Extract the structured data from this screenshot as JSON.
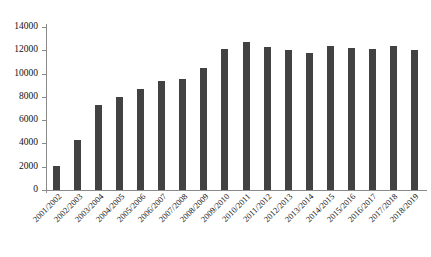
{
  "chart_data": {
    "type": "bar",
    "title": "",
    "subtitle": "",
    "xlabel": "",
    "ylabel": "",
    "categories": [
      "2001/2002",
      "2002/2003",
      "2003/2004",
      "2004/2005",
      "2005/2006",
      "2006/2007",
      "2007/2008",
      "2008/2009",
      "2009/2010",
      "2010/2011",
      "2011/2012",
      "2012/2013",
      "2013/2014",
      "2014/2015",
      "2015/2016",
      "2016/2017",
      "2017/2018",
      "2018/2019"
    ],
    "values": [
      2100,
      4300,
      7300,
      8000,
      8700,
      9400,
      9550,
      10450,
      12150,
      12750,
      12300,
      12000,
      11800,
      12400,
      12200,
      12150,
      12400,
      12000
    ],
    "ylim": [
      0,
      14000
    ],
    "ytick_values": [
      0,
      2000,
      4000,
      6000,
      8000,
      10000,
      12000,
      14000
    ],
    "ytick_labels": [
      "0",
      "2000",
      "4000",
      "6000",
      "8000",
      "10000",
      "12000",
      "14000"
    ],
    "grid": false,
    "legend": null,
    "bar_color": "#424242",
    "axis_color": "#8a8a8a",
    "background_color": "#ffffff"
  }
}
